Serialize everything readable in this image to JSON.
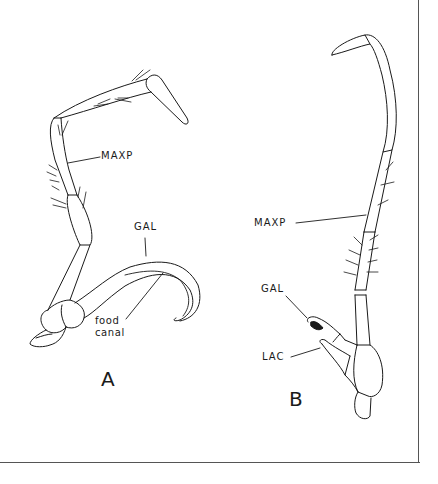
{
  "figure": {
    "panels": [
      {
        "id": "A",
        "letter": "A",
        "labels": {
          "maxp": "MAXP",
          "gal": "GAL",
          "food_canal_line1": "food",
          "food_canal_line2": "canal"
        }
      },
      {
        "id": "B",
        "letter": "B",
        "labels": {
          "maxp": "MAXP",
          "gal": "GAL",
          "lac": "LAC"
        }
      }
    ]
  }
}
